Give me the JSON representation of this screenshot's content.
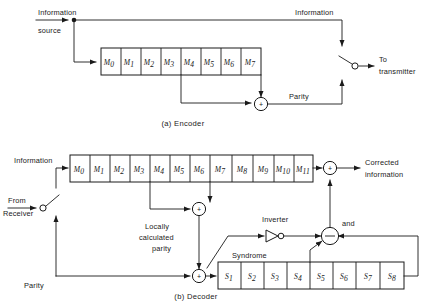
{
  "figure": {
    "background_color": "#ffffff",
    "line_color": "#1a1a1a",
    "width": 428,
    "height": 304
  },
  "encoder": {
    "caption": "(a) Encoder",
    "labels": {
      "information_source_line1": "Information",
      "information_source_line2": "source",
      "information_out": "Information",
      "to_transmitter_line1": "To",
      "to_transmitter_line2": "transmitter",
      "parity": "Parity"
    },
    "register": {
      "name": "encoder-shift-register",
      "cell_count": 8,
      "cells": [
        {
          "symbol": "M",
          "subscript": "0"
        },
        {
          "symbol": "M",
          "subscript": "1"
        },
        {
          "symbol": "M",
          "subscript": "2"
        },
        {
          "symbol": "M",
          "subscript": "3"
        },
        {
          "symbol": "M",
          "subscript": "4"
        },
        {
          "symbol": "M",
          "subscript": "5"
        },
        {
          "symbol": "M",
          "subscript": "6"
        },
        {
          "symbol": "M",
          "subscript": "7"
        }
      ]
    },
    "adder": {
      "symbol": "+",
      "name": "parity-adder"
    },
    "switch": {
      "name": "transmitter-switch",
      "state": "open"
    }
  },
  "decoder": {
    "caption": "(b) Decoder",
    "labels": {
      "information": "Information",
      "from_line1": "From",
      "from_line2": "Receiver",
      "parity": "Parity",
      "locally_calculated_parity_line1": "Locally",
      "locally_calculated_parity_line2": "calculated",
      "locally_calculated_parity_line3": "parity",
      "syndrome": "Syndrome",
      "inverter": "Inverter",
      "and_gate": "and",
      "corrected_line1": "Corrected",
      "corrected_line2": "information"
    },
    "register": {
      "name": "decoder-shift-register",
      "cell_count": 12,
      "cells": [
        {
          "symbol": "M",
          "subscript": "0"
        },
        {
          "symbol": "M",
          "subscript": "1"
        },
        {
          "symbol": "M",
          "subscript": "2"
        },
        {
          "symbol": "M",
          "subscript": "3"
        },
        {
          "symbol": "M",
          "subscript": "4"
        },
        {
          "symbol": "M",
          "subscript": "5"
        },
        {
          "symbol": "M",
          "subscript": "6"
        },
        {
          "symbol": "M",
          "subscript": "7"
        },
        {
          "symbol": "M",
          "subscript": "8"
        },
        {
          "symbol": "M",
          "subscript": "9"
        },
        {
          "symbol": "M",
          "subscript": "10"
        },
        {
          "symbol": "M",
          "subscript": "11"
        }
      ]
    },
    "syndrome_register": {
      "name": "syndrome-shift-register",
      "cell_count": 8,
      "cells": [
        {
          "symbol": "S",
          "subscript": "1"
        },
        {
          "symbol": "S",
          "subscript": "2"
        },
        {
          "symbol": "S",
          "subscript": "3"
        },
        {
          "symbol": "S",
          "subscript": "4"
        },
        {
          "symbol": "S",
          "subscript": "5"
        },
        {
          "symbol": "S",
          "subscript": "6"
        },
        {
          "symbol": "S",
          "subscript": "7"
        },
        {
          "symbol": "S",
          "subscript": "8"
        }
      ]
    },
    "adders": [
      {
        "symbol": "+",
        "name": "local-parity-adder"
      },
      {
        "symbol": "+",
        "name": "syndrome-adder"
      },
      {
        "symbol": "+",
        "name": "correction-adder"
      }
    ],
    "switch": {
      "name": "receiver-switch",
      "state": "open"
    }
  }
}
